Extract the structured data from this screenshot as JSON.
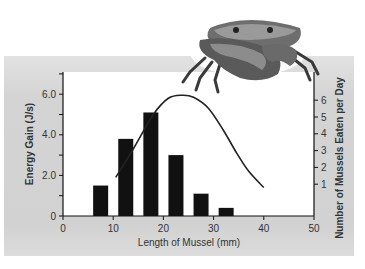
{
  "chart_data": {
    "type": "bar",
    "title": "",
    "xlabel": "Length of Mussel (mm)",
    "ylabel": "Energy Gain (J/s)",
    "ylabel_right": "Number of Mussels Eaten per Day",
    "xlim": [
      0,
      50
    ],
    "ylim": [
      0,
      7
    ],
    "ylim_right": [
      0,
      7
    ],
    "x_ticks": [
      "0",
      "10",
      "20",
      "30",
      "40",
      "50"
    ],
    "y_ticks": [
      "0",
      "2.0",
      "4.0",
      "6.0"
    ],
    "y_ticks_right": [
      "1",
      "2",
      "3",
      "4",
      "5",
      "6"
    ],
    "grid": false,
    "series": [
      {
        "name": "Number of Mussels Eaten per Day",
        "type": "bar",
        "axis": "right",
        "x": [
          7.5,
          12.5,
          17.5,
          22.5,
          27.5,
          32.5
        ],
        "values": [
          1.5,
          3.8,
          5.1,
          3.0,
          1.1,
          0.4
        ]
      },
      {
        "name": "Energy Gain (J/s)",
        "type": "line",
        "axis": "left",
        "x": [
          10.5,
          14,
          18,
          21,
          23.7,
          26,
          29,
          32,
          34.6,
          37,
          40
        ],
        "values": [
          1.9,
          3.3,
          5.0,
          5.8,
          5.95,
          5.85,
          5.3,
          4.2,
          3.1,
          2.2,
          1.4
        ]
      }
    ]
  },
  "labels": {
    "x_axis_title": "Length of Mussel (mm)",
    "y_axis_title": "Energy Gain (J/s)",
    "y2_axis_title": "Number of Mussels Eaten per Day",
    "x_ticks": [
      "0",
      "10",
      "20",
      "30",
      "40",
      "50"
    ],
    "y_ticks": [
      "0",
      "2.0",
      "4.0",
      "6.0"
    ],
    "y2_ticks": [
      "1",
      "2",
      "3",
      "4",
      "5",
      "6"
    ]
  },
  "illustration": "crab-icon"
}
